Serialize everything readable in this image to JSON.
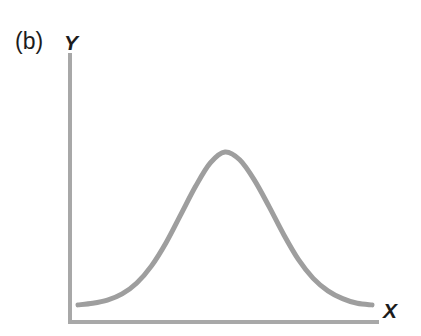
{
  "figure": {
    "panel_label": "(b)",
    "background_color": "#ffffff"
  },
  "chart_data": {
    "type": "line",
    "title": "(b)",
    "subtitle": "",
    "xlabel": "X",
    "ylabel": "Y",
    "axis_label_x": "X",
    "axis_label_y": "Y",
    "grid": false,
    "legend": null,
    "legend_position": "none",
    "xlim": [
      0,
      1
    ],
    "ylim": [
      0,
      1
    ],
    "xticks": [],
    "yticks": [],
    "xticklabels": [],
    "yticklabels": [],
    "annotations": [],
    "series": [
      {
        "name": "bell curve",
        "shape": "gaussian",
        "color": "#9e9e9e",
        "line_width": 5,
        "peak_x": 0.5,
        "peak_y": 1.0,
        "x": [
          0.0,
          0.05,
          0.1,
          0.15,
          0.2,
          0.25,
          0.3,
          0.35,
          0.4,
          0.45,
          0.5,
          0.55,
          0.6,
          0.65,
          0.7,
          0.75,
          0.8,
          0.85,
          0.9,
          0.95,
          1.0
        ],
        "y": [
          0.02,
          0.03,
          0.05,
          0.09,
          0.16,
          0.27,
          0.42,
          0.6,
          0.78,
          0.93,
          1.0,
          0.95,
          0.82,
          0.65,
          0.47,
          0.31,
          0.19,
          0.11,
          0.06,
          0.03,
          0.02
        ]
      }
    ]
  },
  "axes": {
    "color": "#a8a8a8",
    "x_axis_width": 4,
    "y_axis_width": 4
  },
  "colors": {
    "curve": "#9e9e9e",
    "axis": "#a8a8a8",
    "text": "#1c1c1c",
    "background": "#ffffff"
  }
}
